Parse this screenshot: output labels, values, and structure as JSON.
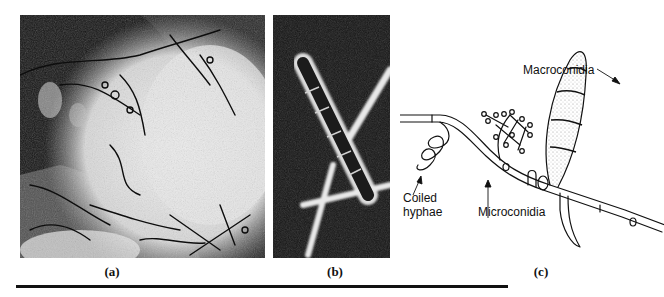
{
  "figure": {
    "panels": [
      {
        "id": "a",
        "caption": "(a)",
        "description": "phase-contrast micrograph of fungal colony"
      },
      {
        "id": "b",
        "caption": "(b)",
        "description": "micrograph of septate hypha on dark background"
      },
      {
        "id": "c",
        "caption": "(c)",
        "description": "line drawing of fungal structures"
      }
    ],
    "diagram_labels": {
      "macroconidia": "Macroconidia",
      "coiled_hyphae_line1": "Coiled",
      "coiled_hyphae_line2": "hyphae",
      "microconidia": "Microconidia"
    },
    "colors": {
      "ink": "#111111",
      "background": "#ffffff"
    }
  }
}
